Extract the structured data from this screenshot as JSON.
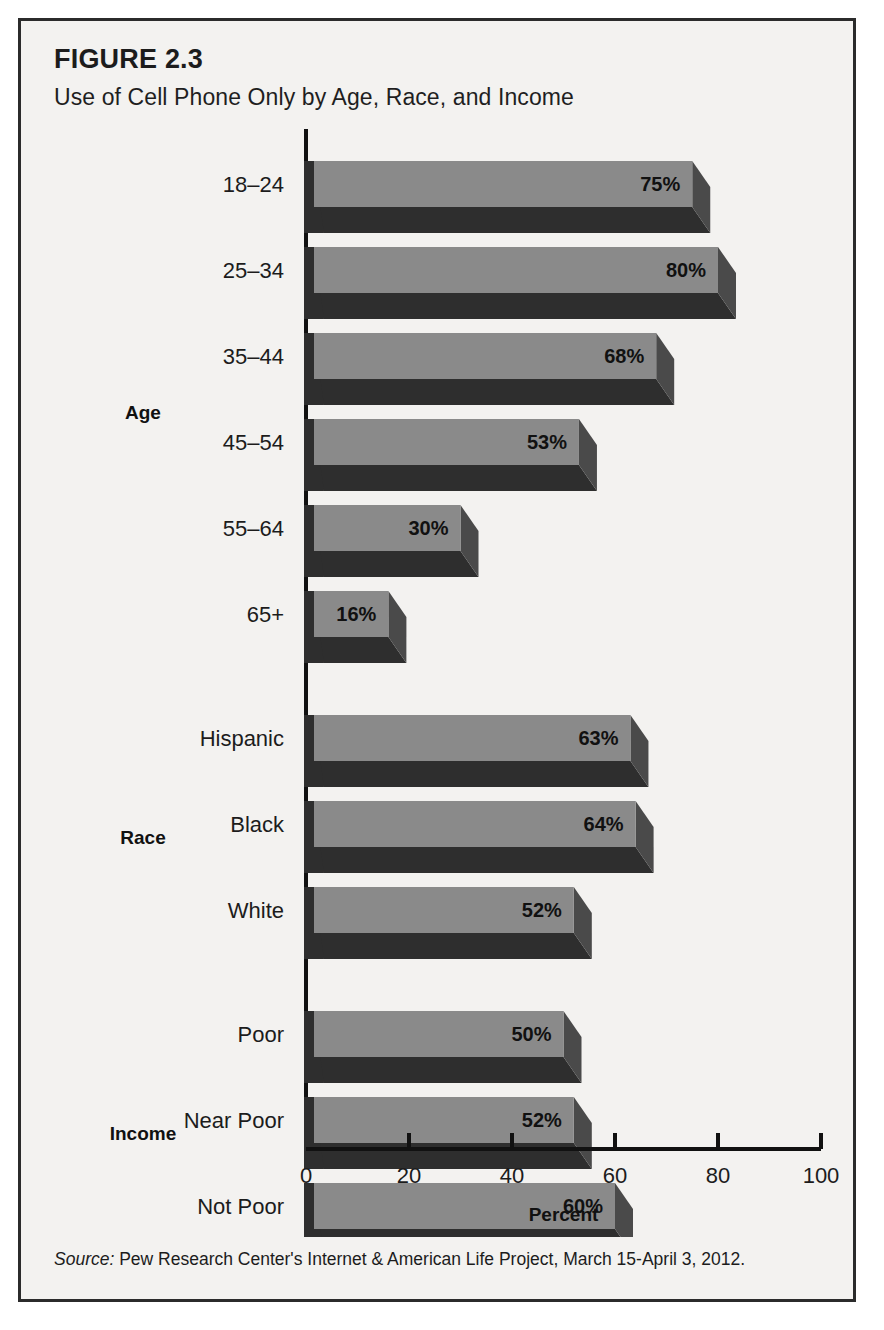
{
  "figure": {
    "label": "FIGURE 2.3",
    "title": "Use of Cell Phone Only by Age, Race, and Income",
    "source_word": "Source:",
    "source_text": " Pew Research Center's Internet & American Life Project, March 15-April 3, 2012."
  },
  "colors": {
    "bar_top_face": "#8a8a8a",
    "bar_front_face": "#2e2e2e",
    "bar_side_face": "#4a4a4a",
    "axis": "#111111",
    "panel_background": "#f3f2f0",
    "frame_border": "#2b2b2b",
    "text": "#1c1c1c"
  },
  "chart_data": {
    "type": "bar",
    "orientation": "horizontal",
    "style": "3d",
    "title": "Use of Cell Phone Only by Age, Race, and Income",
    "xlabel": "Percent",
    "ylabel": "",
    "xlim": [
      0,
      100
    ],
    "xticks": [
      0,
      20,
      40,
      60,
      80,
      100
    ],
    "xtick_labels": [
      "0",
      "20",
      "40",
      "60",
      "80",
      "100"
    ],
    "grid": false,
    "legend": false,
    "value_suffix": "%",
    "groups": [
      {
        "name": "Age",
        "categories": [
          "18–24",
          "25–34",
          "35–44",
          "45–54",
          "55–64",
          "65+"
        ],
        "values": [
          75,
          80,
          68,
          53,
          30,
          16
        ],
        "labels": [
          "75%",
          "80%",
          "68%",
          "53%",
          "30%",
          "16%"
        ]
      },
      {
        "name": "Race",
        "categories": [
          "Hispanic",
          "Black",
          "White"
        ],
        "values": [
          63,
          64,
          52
        ],
        "labels": [
          "63%",
          "64%",
          "52%"
        ]
      },
      {
        "name": "Income",
        "categories": [
          "Poor",
          "Near Poor",
          "Not Poor"
        ],
        "values": [
          50,
          52,
          60
        ],
        "labels": [
          "50%",
          "52%",
          "60%"
        ]
      }
    ]
  }
}
